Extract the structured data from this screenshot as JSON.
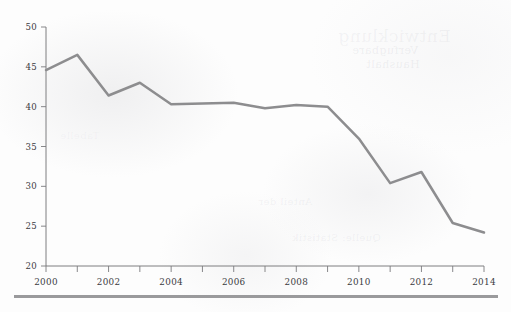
{
  "chart_data": {
    "type": "line",
    "title": "",
    "subtitle": "",
    "xlabel": "",
    "ylabel": "",
    "xlim": [
      2000,
      2014
    ],
    "ylim": [
      20,
      50
    ],
    "grid": false,
    "legend": null,
    "x": [
      2000,
      2001,
      2002,
      2003,
      2004,
      2005,
      2006,
      2007,
      2008,
      2009,
      2010,
      2011,
      2012,
      2013,
      2014
    ],
    "values": [
      44.6,
      46.5,
      41.4,
      43.0,
      40.3,
      40.4,
      40.5,
      39.8,
      40.2,
      40.0,
      36.0,
      30.4,
      31.8,
      25.4,
      24.2
    ],
    "series": [
      {
        "name": "series-1",
        "color": "#8d8d8f",
        "values": [
          44.6,
          46.5,
          41.4,
          43.0,
          40.3,
          40.4,
          40.5,
          39.8,
          40.2,
          40.0,
          36.0,
          30.4,
          31.8,
          25.4,
          24.2
        ]
      }
    ],
    "y_ticks": [
      20,
      25,
      30,
      35,
      40,
      45,
      50
    ],
    "y_tick_labels": [
      "20",
      "25",
      "30",
      "35",
      "40",
      "45",
      "50"
    ],
    "x_ticks": [
      2000,
      2001,
      2002,
      2003,
      2004,
      2005,
      2006,
      2007,
      2008,
      2009,
      2010,
      2011,
      2012,
      2013,
      2014
    ],
    "x_tick_labels": [
      "2000",
      "",
      "2002",
      "",
      "2004",
      "",
      "2006",
      "",
      "2008",
      "",
      "2010",
      "",
      "2012",
      "",
      "2014"
    ],
    "x_labeled_ticks": [
      "2000",
      "2002",
      "2004",
      "2006",
      "2008",
      "2010",
      "2012",
      "2014"
    ],
    "line_color": "#8d8d8f",
    "axis_color": "#6f6f72",
    "background_color": "#fdfdfd",
    "rule_color": "#9a9a9c"
  },
  "bleed_text": {
    "a": "Verfugbare",
    "b": "Haushalt",
    "c": "Entwicklung",
    "d": "Anteil der",
    "e": "Quelle: Statistik",
    "f": "Tabelle"
  }
}
